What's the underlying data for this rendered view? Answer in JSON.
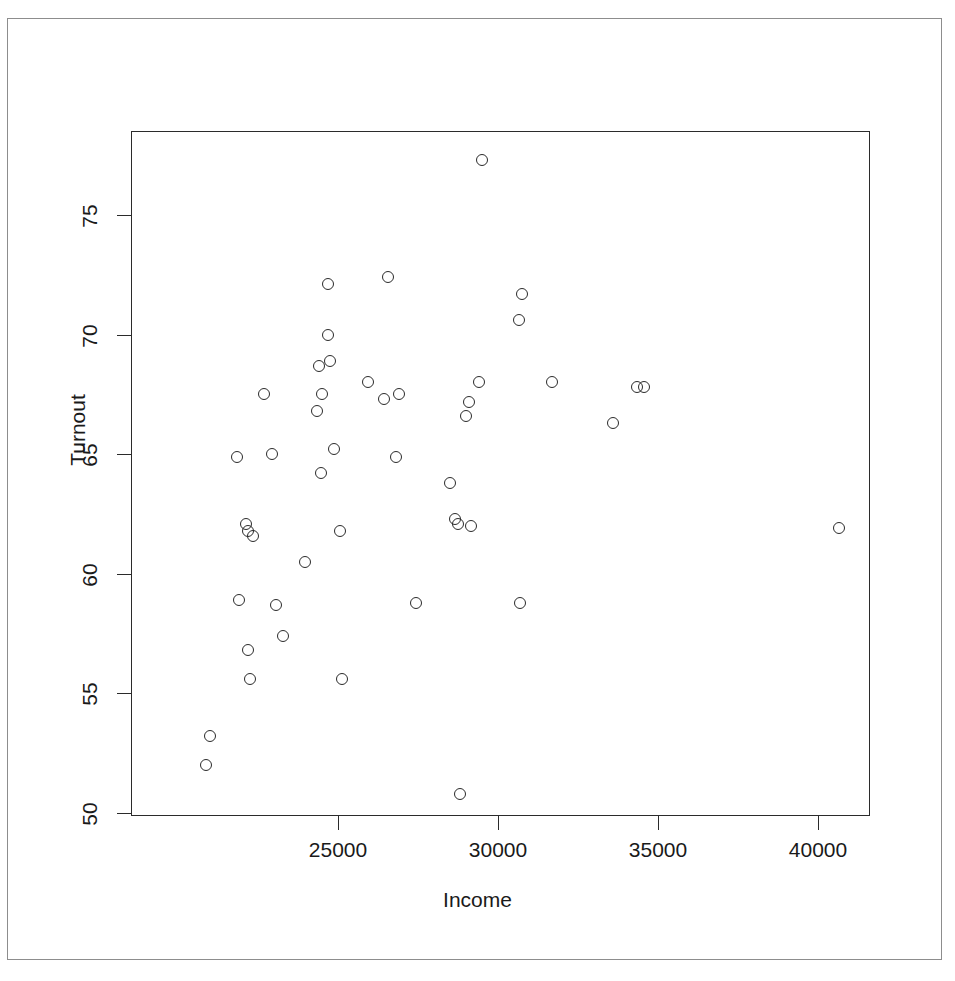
{
  "chart_data": {
    "type": "scatter",
    "title": "",
    "xlabel": "Income",
    "ylabel": "Turnout",
    "xlim": [
      20600,
      41300
    ],
    "ylim": [
      50,
      77.8
    ],
    "grid": false,
    "legend": null,
    "marker": "open-circle",
    "marker_color": "#2b2b2b",
    "x_ticks": [
      25000,
      30000,
      35000,
      40000
    ],
    "x_tick_labels": [
      "25000",
      "30000",
      "35000",
      "40000"
    ],
    "y_ticks": [
      50,
      55,
      60,
      65,
      70,
      75
    ],
    "y_tick_labels": [
      "50",
      "55",
      "60",
      "65",
      "70",
      "75"
    ],
    "n_points": 50,
    "points": [
      {
        "x": 20880,
        "y": 52.0
      },
      {
        "x": 21000,
        "y": 53.2
      },
      {
        "x": 21850,
        "y": 64.9
      },
      {
        "x": 21900,
        "y": 58.9
      },
      {
        "x": 22120,
        "y": 62.1
      },
      {
        "x": 22180,
        "y": 61.8
      },
      {
        "x": 22340,
        "y": 61.6
      },
      {
        "x": 22180,
        "y": 56.8
      },
      {
        "x": 22250,
        "y": 55.6
      },
      {
        "x": 22700,
        "y": 67.5
      },
      {
        "x": 22950,
        "y": 65.0
      },
      {
        "x": 23050,
        "y": 58.7
      },
      {
        "x": 23280,
        "y": 57.4
      },
      {
        "x": 23980,
        "y": 60.5
      },
      {
        "x": 24400,
        "y": 68.7
      },
      {
        "x": 24350,
        "y": 66.8
      },
      {
        "x": 24500,
        "y": 67.5
      },
      {
        "x": 24480,
        "y": 64.2
      },
      {
        "x": 24680,
        "y": 72.1
      },
      {
        "x": 24700,
        "y": 70.0
      },
      {
        "x": 24750,
        "y": 68.9
      },
      {
        "x": 24880,
        "y": 65.2
      },
      {
        "x": 25050,
        "y": 61.8
      },
      {
        "x": 25120,
        "y": 55.6
      },
      {
        "x": 25950,
        "y": 68.0
      },
      {
        "x": 26550,
        "y": 72.4
      },
      {
        "x": 26450,
        "y": 67.3
      },
      {
        "x": 26900,
        "y": 67.5
      },
      {
        "x": 26800,
        "y": 64.9
      },
      {
        "x": 27450,
        "y": 58.8
      },
      {
        "x": 28500,
        "y": 63.8
      },
      {
        "x": 28650,
        "y": 62.3
      },
      {
        "x": 28750,
        "y": 62.1
      },
      {
        "x": 28800,
        "y": 50.8
      },
      {
        "x": 29000,
        "y": 66.6
      },
      {
        "x": 29100,
        "y": 67.2
      },
      {
        "x": 29150,
        "y": 62.0
      },
      {
        "x": 29400,
        "y": 68.0
      },
      {
        "x": 29500,
        "y": 77.3
      },
      {
        "x": 30650,
        "y": 70.6
      },
      {
        "x": 30750,
        "y": 71.7
      },
      {
        "x": 30700,
        "y": 58.8
      },
      {
        "x": 31700,
        "y": 68.0
      },
      {
        "x": 33600,
        "y": 66.3
      },
      {
        "x": 34350,
        "y": 67.8
      },
      {
        "x": 34550,
        "y": 67.8
      },
      {
        "x": 40650,
        "y": 61.9
      }
    ]
  },
  "axes": {
    "y_title": "Turnout",
    "x_title": "Income"
  }
}
